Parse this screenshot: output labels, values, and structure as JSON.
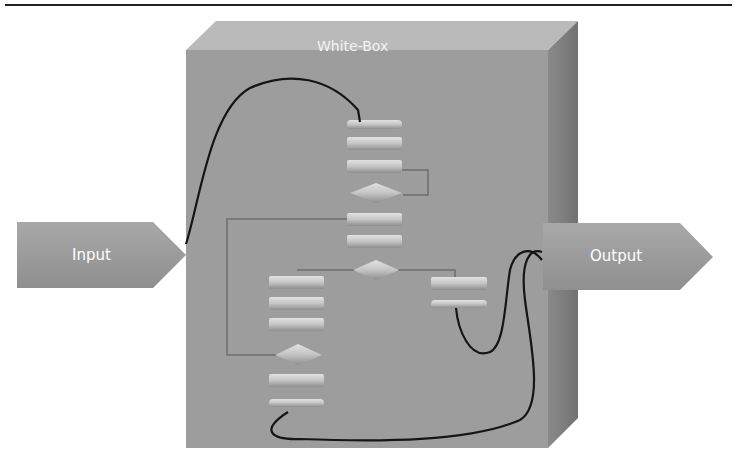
{
  "diagram": {
    "box_title": "White-Box",
    "input_label": "Input",
    "output_label": "Output",
    "colors": {
      "box_front": "#9c9c9c",
      "box_top": "#b9b9b9",
      "box_side": "#7d7d7d",
      "arrow": "#9a9a9a",
      "wire": "#1a1a1a",
      "flow_element": "#c8c8c8"
    },
    "flowchart": {
      "top_column": [
        "process",
        "process",
        "process",
        "decision",
        "process",
        "process",
        "decision"
      ],
      "left_column": [
        "process",
        "process",
        "process",
        "decision",
        "process",
        "process"
      ],
      "right_column": [
        "process",
        "process"
      ]
    }
  }
}
